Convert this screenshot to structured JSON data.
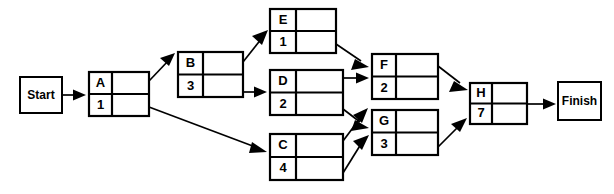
{
  "diagram": {
    "type": "activity-on-node-network",
    "stroke_color": "#000000",
    "background_color": "#ffffff",
    "terminals": [
      {
        "id": "start",
        "label": "Start",
        "x": 20,
        "y": 77,
        "w": 42,
        "h": 36
      },
      {
        "id": "finish",
        "label": "Finish",
        "x": 558,
        "y": 82,
        "w": 43,
        "h": 38
      }
    ],
    "nodes": [
      {
        "id": "A",
        "name": "A",
        "duration": "1",
        "x": 89,
        "y": 72,
        "w": 60,
        "h": 44
      },
      {
        "id": "B",
        "name": "B",
        "duration": "3",
        "x": 178,
        "y": 52,
        "w": 65,
        "h": 45
      },
      {
        "id": "E",
        "name": "E",
        "duration": "1",
        "x": 270,
        "y": 9,
        "w": 66,
        "h": 44
      },
      {
        "id": "D",
        "name": "D",
        "duration": "2",
        "x": 270,
        "y": 70,
        "w": 73,
        "h": 45
      },
      {
        "id": "C",
        "name": "C",
        "duration": "4",
        "x": 270,
        "y": 134,
        "w": 73,
        "h": 46
      },
      {
        "id": "F",
        "name": "F",
        "duration": "2",
        "x": 372,
        "y": 54,
        "w": 66,
        "h": 45
      },
      {
        "id": "G",
        "name": "G",
        "duration": "3",
        "x": 372,
        "y": 110,
        "w": 66,
        "h": 45
      },
      {
        "id": "H",
        "name": "H",
        "duration": "7",
        "x": 470,
        "y": 83,
        "w": 57,
        "h": 41
      }
    ],
    "edges": [
      {
        "id": "start-A",
        "from": "Start",
        "to": "A",
        "points": "62,95 84,95"
      },
      {
        "id": "A-B",
        "from": "A",
        "to": "B",
        "points": "149,80 172,57"
      },
      {
        "id": "A-C",
        "from": "A",
        "to": "C",
        "points": "149,108 265,152"
      },
      {
        "id": "B-E",
        "from": "B",
        "to": "E",
        "points": "243,62 265,33"
      },
      {
        "id": "B-D",
        "from": "B",
        "to": "D",
        "points": "243,92 265,92"
      },
      {
        "id": "E-F",
        "from": "E",
        "to": "F",
        "points": "336,44 367,66"
      },
      {
        "id": "D-F",
        "from": "D",
        "to": "F",
        "points": "343,78 367,78"
      },
      {
        "id": "D-G",
        "from": "D",
        "to": "G",
        "points": "343,110 367,128"
      },
      {
        "id": "C-F",
        "from": "C",
        "to": "F",
        "points": "343,142 367,110"
      },
      {
        "id": "C-G",
        "from": "C",
        "to": "G",
        "points": "343,173 367,137"
      },
      {
        "id": "F-H",
        "from": "F",
        "to": "H",
        "points": "438,66 466,89"
      },
      {
        "id": "G-H",
        "from": "G",
        "to": "H",
        "points": "438,147 466,118"
      },
      {
        "id": "H-Finish",
        "from": "H",
        "to": "Finish",
        "points": "527,104 553,104"
      }
    ]
  }
}
